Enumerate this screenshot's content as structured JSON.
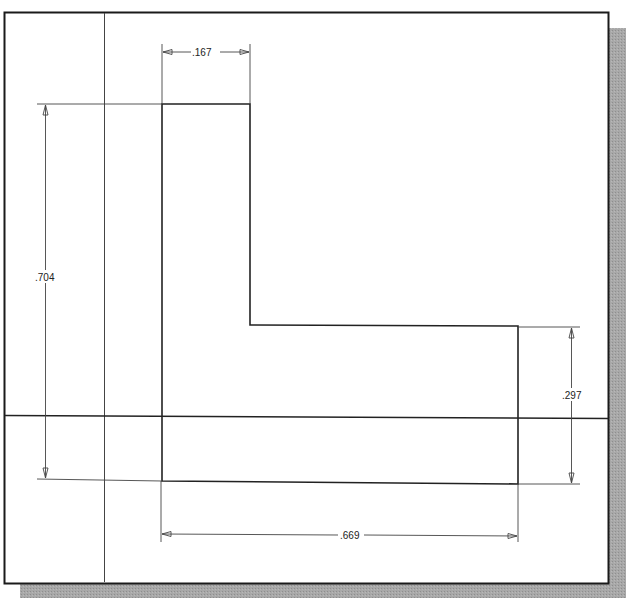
{
  "drawing": {
    "type": "2D sketch with dimensions",
    "shape": "L-profile",
    "dimensions": {
      "top_width": ".167",
      "overall_height": ".704",
      "right_height": ".297",
      "bottom_width": ".669"
    }
  },
  "colors": {
    "background": "#ffffff",
    "frame": "#1a1a1a",
    "shadow": "#9a9a9a",
    "geometry": "#222222",
    "dimension": "#444444",
    "axis": "#333333"
  }
}
